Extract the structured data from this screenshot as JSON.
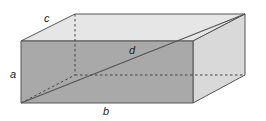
{
  "diagram": {
    "type": "rectangular-prism",
    "labels": {
      "a": "a",
      "b": "b",
      "c": "c",
      "d": "d"
    },
    "label_meaning": {
      "a": "height",
      "b": "length",
      "c": "width",
      "d": "space diagonal"
    },
    "colors": {
      "front_face": "#a9a9a9",
      "top_face": "#e6e6e6",
      "side_face": "#d9d9d9",
      "edge": "#555555",
      "hidden_edge": "#555555",
      "diagonal": "#555555",
      "label": "#222222"
    }
  }
}
